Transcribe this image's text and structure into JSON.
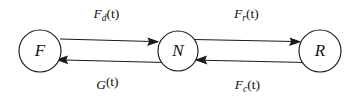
{
  "diagram": {
    "type": "state-flow-diagram",
    "background_color": "#ffffff",
    "line_color": "#1a1a1a",
    "text_color": "#111111",
    "nodes": [
      {
        "id": "F",
        "label": "F",
        "cx": 40,
        "cy": 51,
        "r": 21
      },
      {
        "id": "N",
        "label": "N",
        "cx": 178,
        "cy": 51,
        "r": 20
      },
      {
        "id": "R",
        "label": "R",
        "cx": 320,
        "cy": 51,
        "r": 21
      }
    ],
    "edges": [
      {
        "id": "F-to-N",
        "from": "F",
        "to": "N",
        "direction": "right",
        "position": "top-left",
        "label_base": "F",
        "label_sub": "d",
        "label_arg": "(t)",
        "label_full": "F_d(t)",
        "label_x": 103,
        "label_y": 18
      },
      {
        "id": "N-to-F",
        "from": "N",
        "to": "F",
        "direction": "left",
        "position": "bottom-left",
        "label_base": "G",
        "label_sub": "",
        "label_arg": "(t)",
        "label_full": "G(t)",
        "label_x": 104,
        "label_y": 89
      },
      {
        "id": "N-to-R",
        "from": "N",
        "to": "R",
        "direction": "right",
        "position": "top-right",
        "label_base": "F",
        "label_sub": "r",
        "label_arg": "(t)",
        "label_full": "F_r(t)",
        "label_x": 243,
        "label_y": 18
      },
      {
        "id": "R-to-N",
        "from": "R",
        "to": "N",
        "direction": "left",
        "position": "bottom-right",
        "label_base": "F",
        "label_sub": "c",
        "label_arg": "(t)",
        "label_full": "F_c(t)",
        "label_x": 244,
        "label_y": 89
      }
    ]
  }
}
